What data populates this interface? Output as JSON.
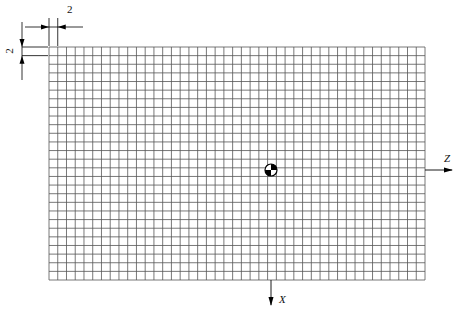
{
  "diagram": {
    "type": "mesh-grid",
    "grid": {
      "columns": 43,
      "rows": 27,
      "line_color": "#555555"
    },
    "dimensions": {
      "cell_width_label": "2",
      "cell_height_label": "2"
    },
    "axes": {
      "horizontal_label": "Z",
      "vertical_label": "X"
    },
    "center_marker": "center-of-mass-symbol"
  }
}
